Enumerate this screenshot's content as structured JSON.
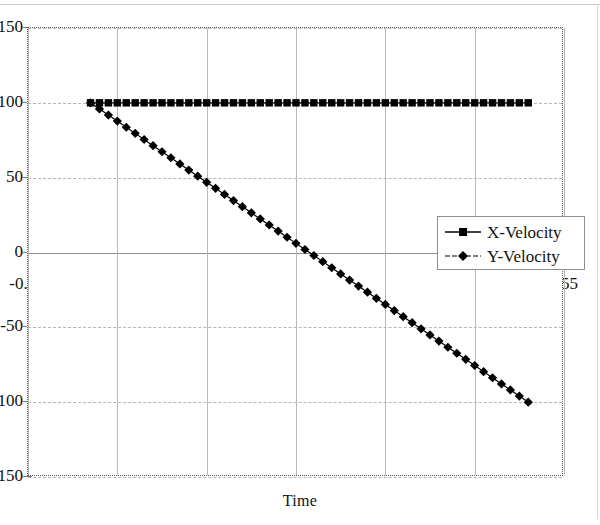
{
  "chart_data": {
    "type": "line",
    "title": "",
    "subtitle": "",
    "xlabel": "Time",
    "ylabel": "",
    "xlim": [
      -0.05,
      0.55
    ],
    "ylim": [
      -150,
      150
    ],
    "grid": true,
    "legend_position": "inside-right",
    "x_ticks": [
      "-0.05",
      "0.05",
      "0.15",
      "0.25",
      "0.35",
      "0.45",
      "0.55"
    ],
    "x_tick_values": [
      -0.05,
      0.05,
      0.15,
      0.25,
      0.35,
      0.45,
      0.55
    ],
    "y_ticks": [
      "150",
      "100",
      "50",
      "0",
      "-50",
      "-100",
      "-150"
    ],
    "y_tick_values": [
      150,
      100,
      50,
      0,
      -50,
      -100,
      -150
    ],
    "x": [
      0.02,
      0.03,
      0.04,
      0.05,
      0.06,
      0.07,
      0.08,
      0.09,
      0.1,
      0.11,
      0.12,
      0.13,
      0.14,
      0.15,
      0.16,
      0.17,
      0.18,
      0.19,
      0.2,
      0.21,
      0.22,
      0.23,
      0.24,
      0.25,
      0.26,
      0.27,
      0.28,
      0.29,
      0.3,
      0.31,
      0.32,
      0.33,
      0.34,
      0.35,
      0.36,
      0.37,
      0.38,
      0.39,
      0.4,
      0.41,
      0.42,
      0.43,
      0.44,
      0.45,
      0.46,
      0.47,
      0.48,
      0.49,
      0.5,
      0.51
    ],
    "series": [
      {
        "name": "X-Velocity",
        "marker": "square",
        "color": "#000000",
        "values": [
          100,
          100,
          100,
          100,
          100,
          100,
          100,
          100,
          100,
          100,
          100,
          100,
          100,
          100,
          100,
          100,
          100,
          100,
          100,
          100,
          100,
          100,
          100,
          100,
          100,
          100,
          100,
          100,
          100,
          100,
          100,
          100,
          100,
          100,
          100,
          100,
          100,
          100,
          100,
          100,
          100,
          100,
          100,
          100,
          100,
          100,
          100,
          100,
          100,
          100
        ]
      },
      {
        "name": "Y-Velocity",
        "marker": "diamond",
        "color": "#000000",
        "values": [
          100,
          95.9,
          91.8,
          87.8,
          83.7,
          79.6,
          75.5,
          71.4,
          67.3,
          63.3,
          59.2,
          55.1,
          51.0,
          46.9,
          42.9,
          38.8,
          34.7,
          30.6,
          26.5,
          22.4,
          18.4,
          14.3,
          10.2,
          6.1,
          2.0,
          -2.0,
          -6.1,
          -10.2,
          -14.3,
          -18.4,
          -22.4,
          -26.5,
          -30.6,
          -34.7,
          -38.8,
          -42.9,
          -46.9,
          -51.0,
          -55.1,
          -59.2,
          -63.3,
          -67.3,
          -71.4,
          -75.5,
          -79.6,
          -83.7,
          -87.8,
          -91.8,
          -95.9,
          -100
        ]
      }
    ]
  },
  "legend": {
    "entries": [
      {
        "label": "X-Velocity",
        "marker": "square"
      },
      {
        "label": "Y-Velocity",
        "marker": "diamond"
      }
    ]
  },
  "axes": {
    "x_title": "Time"
  }
}
